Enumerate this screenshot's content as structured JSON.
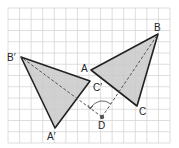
{
  "diagram": {
    "type": "geometric-rotation",
    "grid": {
      "x0": 8,
      "y0": 8,
      "x1": 170,
      "y1": 143,
      "cols": 14,
      "rows": 12,
      "color": "#d6d6d6"
    },
    "colors": {
      "fill": "#c9c9c9",
      "stroke": "#222222",
      "dashed": "#555555",
      "point": "#555555"
    },
    "triangles": [
      {
        "name": "ABC",
        "vertices": {
          "A": {
            "x": 91,
            "y": 70
          },
          "B": {
            "x": 158,
            "y": 34
          },
          "C": {
            "x": 137,
            "y": 106
          }
        }
      },
      {
        "name": "A'B'C'",
        "vertices": {
          "A'": {
            "x": 55,
            "y": 128
          },
          "B'": {
            "x": 21,
            "y": 57
          },
          "C'": {
            "x": 90,
            "y": 81
          }
        }
      }
    ],
    "center": {
      "name": "D",
      "x": 102,
      "y": 117
    },
    "labels": {
      "A": "A",
      "B": "B",
      "C": "C",
      "A_prime": "A′",
      "B_prime": "B′",
      "C_prime": "C′",
      "D": "D"
    }
  }
}
